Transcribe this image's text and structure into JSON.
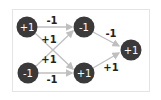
{
  "diagram": {
    "type": "neural-network",
    "colors": {
      "node_fill": "#3a3a3a",
      "node_text": "#ffffff",
      "edge": "#bfbfbf",
      "edge_label": "#222222",
      "frame_border": "#e4e4e4"
    },
    "nodes": [
      {
        "id": "in_top",
        "label": "+1"
      },
      {
        "id": "in_bottom",
        "label": "-1"
      },
      {
        "id": "hidden_top",
        "label": "-1"
      },
      {
        "id": "hidden_bottom",
        "label": "+1"
      },
      {
        "id": "output",
        "label": "+1"
      }
    ],
    "edges": [
      {
        "from": "in_top",
        "to": "hidden_top",
        "label": "-1"
      },
      {
        "from": "in_top",
        "to": "hidden_bottom",
        "label": "+1"
      },
      {
        "from": "in_bottom",
        "to": "hidden_top",
        "label": "+1"
      },
      {
        "from": "in_bottom",
        "to": "hidden_bottom",
        "label": "-1"
      },
      {
        "from": "hidden_top",
        "to": "output",
        "label": "-1"
      },
      {
        "from": "hidden_bottom",
        "to": "output",
        "label": "+1"
      }
    ]
  }
}
